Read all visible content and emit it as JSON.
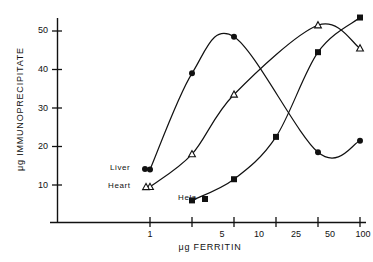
{
  "chart_data": {
    "type": "line",
    "title": "",
    "xlabel": "μg FERRITIN",
    "ylabel": "μg IMMUNOPRECIPITATE",
    "x_scale": "categorical-log",
    "x_categories": [
      "1",
      "5",
      "10",
      "25",
      "50",
      "100"
    ],
    "x_tick_labels": [
      "1",
      "5",
      "10",
      "25",
      "50",
      "100"
    ],
    "y_tick_labels": [
      "10",
      "20",
      "30",
      "40",
      "50"
    ],
    "y_ticks": [
      10,
      20,
      30,
      40,
      50
    ],
    "ylim": [
      0,
      56
    ],
    "grid": false,
    "legend_position": "inline-left",
    "series": [
      {
        "name": "Liver",
        "marker": "filled-circle",
        "color": "#111111",
        "x": [
          "1",
          "5",
          "10",
          "25",
          "50",
          "100"
        ],
        "values": [
          14.0,
          39.0,
          48.5,
          null,
          18.5,
          21.5
        ]
      },
      {
        "name": "Heart",
        "marker": "open-triangle",
        "color": "#111111",
        "x": [
          "1",
          "5",
          "10",
          "25",
          "50",
          "100"
        ],
        "values": [
          9.5,
          18.0,
          33.5,
          null,
          51.5,
          45.5
        ]
      },
      {
        "name": "Hela",
        "marker": "filled-square",
        "color": "#111111",
        "x": [
          "1",
          "5",
          "10",
          "25",
          "50",
          "100"
        ],
        "values": [
          null,
          6.0,
          11.5,
          22.5,
          44.5,
          53.5
        ]
      }
    ],
    "annotations": [
      {
        "text": "Liver",
        "marker": "filled-circle"
      },
      {
        "text": "Heart",
        "marker": "open-triangle"
      },
      {
        "text": "Hela",
        "marker": "filled-square"
      }
    ]
  },
  "axes": {
    "y_title": "μg IMMUNOPRECIPITATE",
    "x_title": "μg FERRITIN",
    "y_labels": [
      "50",
      "40",
      "30",
      "20",
      "10"
    ],
    "x_labels": [
      "1",
      "5",
      "10",
      "25",
      "50",
      "100"
    ]
  },
  "labels": {
    "liver": "Liver",
    "heart": "Heart",
    "hela": "Hela"
  }
}
